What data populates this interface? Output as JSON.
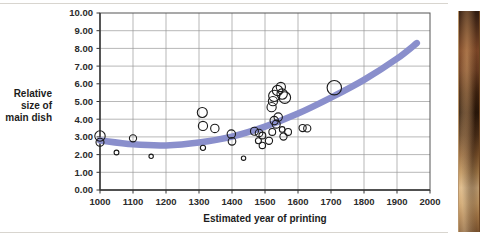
{
  "figure": {
    "name": "scatter-chart-main-dish-size-vs-year",
    "background_color": "#ffffff"
  },
  "photo": {
    "name": "painting-strip",
    "alt": "partial painting photograph at right edge"
  },
  "chart_data": {
    "type": "scatter",
    "title": "",
    "subtitle": "",
    "xlabel": "Estimated year of printing",
    "ylabel": "Relative size of main dish",
    "ylabel_lines": [
      "Relative",
      "size of",
      "main dish"
    ],
    "xlim": [
      1000,
      2000
    ],
    "ylim": [
      0,
      10
    ],
    "xticks": [
      1000,
      1100,
      1200,
      1300,
      1400,
      1500,
      1600,
      1700,
      1800,
      1900,
      2000
    ],
    "xtick_labels": [
      "1000",
      "1100",
      "1200",
      "1300",
      "1400",
      "1500",
      "1600",
      "1700",
      "1800",
      "1900",
      "2000"
    ],
    "yticks": [
      0,
      1,
      2,
      3,
      4,
      5,
      6,
      7,
      8,
      9,
      10
    ],
    "ytick_labels": [
      "0.00",
      "1.00",
      "2.00",
      "3.00",
      "4.00",
      "5.00",
      "6.00",
      "7.00",
      "8.00",
      "9.00",
      "10.00"
    ],
    "grid": true,
    "grid_color": "#9a9a9a",
    "legend": false,
    "marker_style": "open-circle",
    "marker_edge_color": "#1a1a1a",
    "marker_fill_color": "none",
    "note": "Bubble sizes vary; radius encodes an unlabeled third variable.",
    "points": [
      {
        "x": 1000,
        "y": 3.05,
        "r": 5.2
      },
      {
        "x": 1000,
        "y": 2.7,
        "r": 4.0
      },
      {
        "x": 1050,
        "y": 2.12,
        "r": 2.4
      },
      {
        "x": 1100,
        "y": 2.92,
        "r": 3.6
      },
      {
        "x": 1155,
        "y": 1.9,
        "r": 2.2
      },
      {
        "x": 1310,
        "y": 4.38,
        "r": 5.0
      },
      {
        "x": 1312,
        "y": 3.62,
        "r": 4.6
      },
      {
        "x": 1348,
        "y": 3.48,
        "r": 4.2
      },
      {
        "x": 1312,
        "y": 2.38,
        "r": 2.6
      },
      {
        "x": 1398,
        "y": 3.16,
        "r": 4.2
      },
      {
        "x": 1400,
        "y": 2.75,
        "r": 3.8
      },
      {
        "x": 1435,
        "y": 1.8,
        "r": 2.2
      },
      {
        "x": 1468,
        "y": 3.32,
        "r": 4.0
      },
      {
        "x": 1482,
        "y": 3.22,
        "r": 3.8
      },
      {
        "x": 1492,
        "y": 3.08,
        "r": 3.4
      },
      {
        "x": 1480,
        "y": 2.78,
        "r": 3.0
      },
      {
        "x": 1492,
        "y": 2.52,
        "r": 3.2
      },
      {
        "x": 1512,
        "y": 2.78,
        "r": 3.6
      },
      {
        "x": 1520,
        "y": 4.68,
        "r": 4.6
      },
      {
        "x": 1528,
        "y": 5.32,
        "r": 5.6
      },
      {
        "x": 1524,
        "y": 5.02,
        "r": 4.6
      },
      {
        "x": 1538,
        "y": 5.62,
        "r": 5.2
      },
      {
        "x": 1548,
        "y": 5.82,
        "r": 4.6
      },
      {
        "x": 1552,
        "y": 5.42,
        "r": 5.2
      },
      {
        "x": 1560,
        "y": 5.22,
        "r": 5.8
      },
      {
        "x": 1528,
        "y": 3.92,
        "r": 4.2
      },
      {
        "x": 1540,
        "y": 4.12,
        "r": 4.2
      },
      {
        "x": 1534,
        "y": 3.72,
        "r": 4.0
      },
      {
        "x": 1522,
        "y": 3.28,
        "r": 3.4
      },
      {
        "x": 1552,
        "y": 3.42,
        "r": 2.8
      },
      {
        "x": 1556,
        "y": 3.02,
        "r": 3.6
      },
      {
        "x": 1570,
        "y": 3.28,
        "r": 3.4
      },
      {
        "x": 1614,
        "y": 3.5,
        "r": 3.6
      },
      {
        "x": 1628,
        "y": 3.48,
        "r": 3.6
      },
      {
        "x": 1710,
        "y": 5.78,
        "r": 7.2
      }
    ],
    "trend": {
      "name": "fitted-trend-curve",
      "color": "#8a8fcc",
      "width": 6.5,
      "x_start": 1000,
      "x_end": 1960,
      "points": [
        {
          "x": 1000,
          "y": 2.8
        },
        {
          "x": 1100,
          "y": 2.58
        },
        {
          "x": 1200,
          "y": 2.52
        },
        {
          "x": 1300,
          "y": 2.68
        },
        {
          "x": 1400,
          "y": 3.02
        },
        {
          "x": 1500,
          "y": 3.58
        },
        {
          "x": 1600,
          "y": 4.32
        },
        {
          "x": 1700,
          "y": 5.22
        },
        {
          "x": 1800,
          "y": 6.22
        },
        {
          "x": 1900,
          "y": 7.42
        },
        {
          "x": 1960,
          "y": 8.3
        }
      ]
    }
  }
}
